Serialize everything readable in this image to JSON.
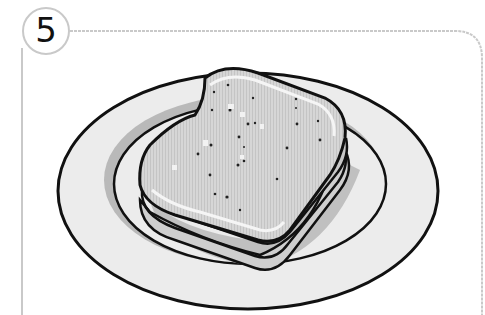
{
  "panel": {
    "step_number": "5",
    "illustration": {
      "subject": "sandwich-on-plate",
      "description": "A stacked sandwich of bread slices resting on an oval plate"
    },
    "colors": {
      "frame": "#c9c9c9",
      "outline": "#111111",
      "plate_fill": "#ececec",
      "plate_inner_shadow": "#b9b9b9",
      "bread_fill": "#d4d4d4",
      "crust_fill": "#c6c6c6",
      "highlight": "#f5f5f5"
    }
  }
}
